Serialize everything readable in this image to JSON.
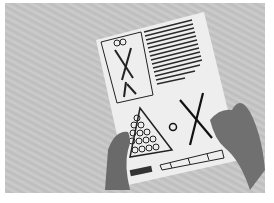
{
  "image": {
    "description": "Black and white photo of two hands holding a printed sheet with a pick-up-sticks and ball-triangle illustration",
    "subject": "printed instruction sheet",
    "elements": [
      "crossed-sticks-panel",
      "text-column",
      "ball-triangle",
      "circled-number",
      "large-crossed-sticks",
      "score-boxes",
      "barcode",
      "hands"
    ],
    "palette": {
      "background": "#c4c4c4",
      "paper": "#f2f2f2",
      "ink": "#1a1a1a",
      "skin": "#6a6a6a"
    }
  }
}
